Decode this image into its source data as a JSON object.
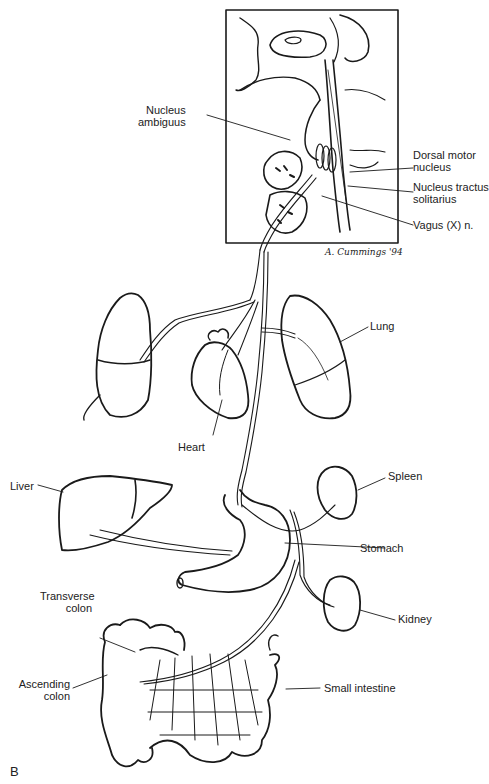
{
  "figure": {
    "panel_letter": "B",
    "signature": "A. Cummings '94",
    "inset_box": {
      "x": 226,
      "y": 10,
      "width": 172,
      "height": 233
    },
    "labels": {
      "nucleus_ambiguus": [
        "Nucleus",
        "ambiguus"
      ],
      "dorsal_motor_nucleus": [
        "Dorsal motor",
        "nucleus"
      ],
      "nucleus_tractus_solitarius": [
        "Nucleus tractus",
        "solitarius"
      ],
      "vagus_nerve": "Vagus (X) n.",
      "lung": "Lung",
      "heart": "Heart",
      "liver": "Liver",
      "spleen": "Spleen",
      "stomach": "Stomach",
      "kidney": "Kidney",
      "transverse_colon": [
        "Transverse",
        "colon"
      ],
      "ascending_colon": [
        "Ascending",
        "colon"
      ],
      "small_intestine": "Small intestine"
    },
    "colors": {
      "ink": "#1a1a1a",
      "background": "#ffffff"
    }
  }
}
